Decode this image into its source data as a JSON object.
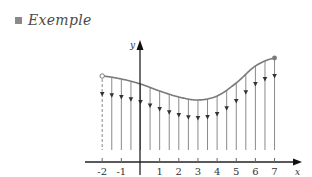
{
  "title": "Exemple",
  "diagram": {
    "type": "function-graph-with-vertical-arrows",
    "x_axis": {
      "label": "x",
      "ticks": [
        -2,
        -1,
        1,
        2,
        3,
        4,
        5,
        6,
        7
      ],
      "tick_labels": [
        "-2",
        "-1",
        "1",
        "2",
        "3",
        "4",
        "5",
        "6",
        "7"
      ]
    },
    "y_axis": {
      "label": "y"
    },
    "curve": {
      "x_range": [
        -2,
        7
      ],
      "start_point": {
        "x": -2,
        "style": "open-circle"
      },
      "end_point": {
        "x": 7,
        "style": "filled-circle"
      },
      "shape": "decreasing to a minimum near x=3, then increasing"
    },
    "arrows": {
      "spacing": 0.5,
      "direction": "down",
      "count": 19
    },
    "colors": {
      "curve": "#7a7a7a",
      "lines": "#8a8a8a",
      "axis": "#222222",
      "arrowhead": "#333333"
    }
  },
  "chart_data": {
    "type": "line",
    "title": "Exemple",
    "xlabel": "x",
    "ylabel": "y",
    "x": [
      -2,
      -1.5,
      -1,
      -0.5,
      0,
      0.5,
      1,
      1.5,
      2,
      2.5,
      3,
      3.5,
      4,
      4.5,
      5,
      5.5,
      6,
      6.5,
      7
    ],
    "xticks": [
      "-2",
      "-1",
      "1",
      "2",
      "3",
      "4",
      "5",
      "6",
      "7"
    ],
    "grid": false
  }
}
